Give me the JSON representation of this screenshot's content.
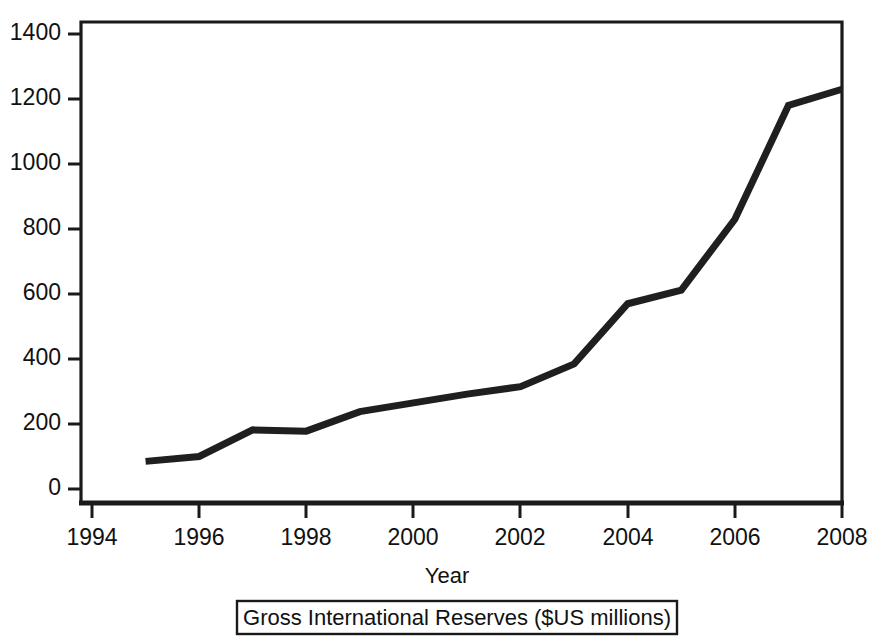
{
  "chart_data": {
    "type": "line",
    "title": "",
    "caption": "Gross International Reserves ($US millions)",
    "xlabel": "Year",
    "ylabel": "",
    "x": [
      1995,
      1996,
      1997,
      1998,
      1999,
      2000,
      2001,
      2002,
      2003,
      2004,
      2005,
      2006,
      2007,
      2008
    ],
    "values": [
      85,
      100,
      182,
      178,
      238,
      265,
      292,
      315,
      385,
      570,
      612,
      830,
      1180,
      1230
    ],
    "series": [
      {
        "name": "Gross International Reserves",
        "values": [
          85,
          100,
          182,
          178,
          238,
          265,
          292,
          315,
          385,
          570,
          612,
          830,
          1180,
          1230
        ]
      }
    ],
    "xlim": [
      1994,
      2008
    ],
    "ylim": [
      0,
      1400
    ],
    "xticks": [
      1994,
      1996,
      1998,
      2000,
      2002,
      2004,
      2006,
      2008
    ],
    "yticks": [
      0,
      200,
      400,
      600,
      800,
      1000,
      1200,
      1400
    ],
    "xtick_labels": [
      "1994",
      "1996",
      "1998",
      "2000",
      "2002",
      "2004",
      "2006",
      "2008"
    ],
    "ytick_labels": [
      "0",
      "200",
      "400",
      "600",
      "800",
      "1000",
      "1200",
      "1400"
    ],
    "grid": false,
    "legend": "none",
    "line_color": "#1f1f1f"
  }
}
